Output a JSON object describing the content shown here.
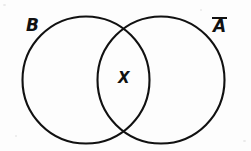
{
  "figure": {
    "type": "venn-diagram",
    "title": "",
    "background_color": "#fdfdfd",
    "stroke_color": "#111111",
    "stroke_width": 2.1,
    "width": 251,
    "height": 151
  },
  "circles": [
    {
      "id": "left-set",
      "label": "B",
      "cx": 86,
      "cy": 80,
      "r": 63.5,
      "label_x": 26,
      "label_y": 17
    },
    {
      "id": "right-set",
      "label": "A",
      "label_notation": "complement-overbar",
      "cx": 161,
      "cy": 80,
      "r": 63.5,
      "label_x": 213,
      "label_y": 17
    }
  ],
  "regions": [
    {
      "id": "intersection",
      "label": "X",
      "label_x": 118,
      "label_y": 71,
      "description": "lens-shaped overlap of B and A-complement"
    }
  ]
}
